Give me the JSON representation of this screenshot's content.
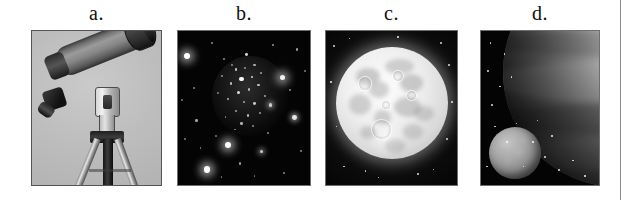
{
  "figure": {
    "caption_style": "lettered-panels",
    "panel_count": 4,
    "background_color": "#ffffff",
    "margin_rule_color": "#8a8a8a"
  },
  "panels": [
    {
      "id": "a",
      "label": "a.",
      "subject": "telescope-on-tripod",
      "alt": "A refracting telescope mounted on a metal tripod, photographed against a plain light gray studio background.",
      "background_color": "#b9b9b9",
      "frame_border_color": "#555555"
    },
    {
      "id": "b",
      "label": "b.",
      "subject": "star-cluster",
      "alt": "A dense field of stars forming an open star cluster against a black night sky.",
      "background_color": "#040404",
      "frame_border_color": "#6e6e6e"
    },
    {
      "id": "c",
      "label": "c.",
      "subject": "full-moon",
      "alt": "The full Moon showing bright highlands, dark maria and bright crater ray systems.",
      "background_color": "#0a0a0a",
      "frame_border_color": "#6e6e6e"
    },
    {
      "id": "d",
      "label": "d.",
      "subject": "planet-and-moon",
      "alt": "The limb of a large banded planet at upper right with a smaller gray moon at lower left.",
      "background_color": "#050505",
      "frame_border_color": "#6e6e6e"
    }
  ],
  "stars": {
    "cluster_members": [
      {
        "x": 35,
        "y": 18,
        "r": 1.0,
        "b": 0.55
      },
      {
        "x": 44,
        "y": 25,
        "r": 1.2,
        "b": 0.75
      },
      {
        "x": 52,
        "y": 15,
        "r": 1.4,
        "b": 0.85
      },
      {
        "x": 58,
        "y": 22,
        "r": 1.1,
        "b": 0.65
      },
      {
        "x": 48,
        "y": 31,
        "r": 2.2,
        "b": 1.0
      },
      {
        "x": 56,
        "y": 30,
        "r": 1.3,
        "b": 0.8
      },
      {
        "x": 63,
        "y": 27,
        "r": 1.0,
        "b": 0.6
      },
      {
        "x": 40,
        "y": 34,
        "r": 1.2,
        "b": 0.7
      },
      {
        "x": 33,
        "y": 29,
        "r": 1.0,
        "b": 0.55
      },
      {
        "x": 46,
        "y": 40,
        "r": 1.5,
        "b": 0.85
      },
      {
        "x": 54,
        "y": 38,
        "r": 1.1,
        "b": 0.65
      },
      {
        "x": 61,
        "y": 35,
        "r": 1.3,
        "b": 0.72
      },
      {
        "x": 38,
        "y": 44,
        "r": 1.2,
        "b": 0.68
      },
      {
        "x": 50,
        "y": 46,
        "r": 1.0,
        "b": 0.6
      },
      {
        "x": 58,
        "y": 47,
        "r": 1.4,
        "b": 0.78
      },
      {
        "x": 44,
        "y": 52,
        "r": 1.1,
        "b": 0.62
      },
      {
        "x": 53,
        "y": 55,
        "r": 1.3,
        "b": 0.7
      },
      {
        "x": 36,
        "y": 56,
        "r": 0.9,
        "b": 0.5
      },
      {
        "x": 62,
        "y": 53,
        "r": 1.0,
        "b": 0.58
      },
      {
        "x": 48,
        "y": 60,
        "r": 1.2,
        "b": 0.66
      },
      {
        "x": 41,
        "y": 22,
        "r": 0.9,
        "b": 0.5
      },
      {
        "x": 66,
        "y": 42,
        "r": 1.1,
        "b": 0.62
      },
      {
        "x": 30,
        "y": 40,
        "r": 0.9,
        "b": 0.48
      },
      {
        "x": 57,
        "y": 62,
        "r": 1.0,
        "b": 0.55
      },
      {
        "x": 43,
        "y": 64,
        "r": 0.9,
        "b": 0.5
      },
      {
        "x": 51,
        "y": 24,
        "r": 0.9,
        "b": 0.52
      }
    ],
    "field_stars": [
      {
        "x": 7,
        "y": 16,
        "r": 3.0,
        "b": 1.0,
        "glow": "big"
      },
      {
        "x": 79,
        "y": 30,
        "r": 2.6,
        "b": 0.95,
        "glow": "big"
      },
      {
        "x": 88,
        "y": 56,
        "r": 2.4,
        "b": 0.9,
        "glow": "yes"
      },
      {
        "x": 38,
        "y": 74,
        "r": 3.0,
        "b": 1.0,
        "glow": "big"
      },
      {
        "x": 22,
        "y": 90,
        "r": 3.2,
        "b": 1.0,
        "glow": "big"
      },
      {
        "x": 70,
        "y": 48,
        "r": 1.8,
        "b": 0.8,
        "glow": "yes"
      },
      {
        "x": 63,
        "y": 78,
        "r": 1.6,
        "b": 0.78,
        "glow": "yes"
      },
      {
        "x": 14,
        "y": 58,
        "r": 1.2,
        "b": 0.62
      },
      {
        "x": 90,
        "y": 12,
        "r": 1.2,
        "b": 0.6
      },
      {
        "x": 26,
        "y": 8,
        "r": 1.0,
        "b": 0.55
      },
      {
        "x": 72,
        "y": 9,
        "r": 1.1,
        "b": 0.58
      },
      {
        "x": 12,
        "y": 37,
        "r": 1.0,
        "b": 0.52
      },
      {
        "x": 5,
        "y": 70,
        "r": 1.0,
        "b": 0.5
      },
      {
        "x": 93,
        "y": 78,
        "r": 1.1,
        "b": 0.56
      },
      {
        "x": 47,
        "y": 86,
        "r": 1.2,
        "b": 0.6
      },
      {
        "x": 80,
        "y": 92,
        "r": 1.0,
        "b": 0.52
      },
      {
        "x": 33,
        "y": 95,
        "r": 0.9,
        "b": 0.48
      },
      {
        "x": 58,
        "y": 94,
        "r": 0.9,
        "b": 0.46
      },
      {
        "x": 17,
        "y": 76,
        "r": 0.9,
        "b": 0.48
      },
      {
        "x": 85,
        "y": 38,
        "r": 1.0,
        "b": 0.54
      },
      {
        "x": 96,
        "y": 26,
        "r": 0.9,
        "b": 0.48
      },
      {
        "x": 3,
        "y": 45,
        "r": 0.9,
        "b": 0.46
      },
      {
        "x": 68,
        "y": 66,
        "r": 1.0,
        "b": 0.52
      },
      {
        "x": 29,
        "y": 68,
        "r": 0.9,
        "b": 0.45
      }
    ],
    "moon_panel_stars": [
      {
        "x": 6,
        "y": 10,
        "r": 1.0
      },
      {
        "x": 18,
        "y": 5,
        "r": 0.8
      },
      {
        "x": 88,
        "y": 8,
        "r": 1.1
      },
      {
        "x": 94,
        "y": 22,
        "r": 0.9
      },
      {
        "x": 4,
        "y": 33,
        "r": 0.8
      },
      {
        "x": 96,
        "y": 46,
        "r": 0.9
      },
      {
        "x": 8,
        "y": 62,
        "r": 0.8
      },
      {
        "x": 92,
        "y": 70,
        "r": 1.0
      },
      {
        "x": 14,
        "y": 88,
        "r": 0.9
      },
      {
        "x": 40,
        "y": 95,
        "r": 0.8
      },
      {
        "x": 70,
        "y": 93,
        "r": 0.9
      },
      {
        "x": 55,
        "y": 4,
        "r": 0.8
      },
      {
        "x": 30,
        "y": 91,
        "r": 0.8
      },
      {
        "x": 82,
        "y": 90,
        "r": 0.8
      }
    ],
    "planet_panel_stars": [
      {
        "x": 8,
        "y": 8,
        "r": 0.9
      },
      {
        "x": 20,
        "y": 15,
        "r": 0.8
      },
      {
        "x": 6,
        "y": 26,
        "r": 0.9
      },
      {
        "x": 16,
        "y": 36,
        "r": 0.8
      },
      {
        "x": 9,
        "y": 48,
        "r": 0.9
      },
      {
        "x": 26,
        "y": 30,
        "r": 0.8
      },
      {
        "x": 30,
        "y": 60,
        "r": 0.9
      },
      {
        "x": 44,
        "y": 72,
        "r": 0.8
      },
      {
        "x": 54,
        "y": 82,
        "r": 0.9
      },
      {
        "x": 36,
        "y": 88,
        "r": 0.8
      },
      {
        "x": 66,
        "y": 90,
        "r": 0.9
      },
      {
        "x": 22,
        "y": 72,
        "r": 0.8
      },
      {
        "x": 12,
        "y": 62,
        "r": 0.8
      },
      {
        "x": 48,
        "y": 58,
        "r": 0.8
      },
      {
        "x": 60,
        "y": 68,
        "r": 0.8
      },
      {
        "x": 78,
        "y": 84,
        "r": 0.8
      },
      {
        "x": 88,
        "y": 94,
        "r": 0.8
      },
      {
        "x": 5,
        "y": 88,
        "r": 0.8
      }
    ]
  },
  "moon_features": {
    "maria": [
      {
        "x": 18,
        "y": 18,
        "w": 22,
        "h": 16,
        "o": 0.35
      },
      {
        "x": 44,
        "y": 10,
        "w": 26,
        "h": 14,
        "o": 0.3
      },
      {
        "x": 58,
        "y": 24,
        "w": 20,
        "h": 16,
        "o": 0.34
      },
      {
        "x": 30,
        "y": 30,
        "w": 18,
        "h": 15,
        "o": 0.32
      },
      {
        "x": 12,
        "y": 42,
        "w": 20,
        "h": 18,
        "o": 0.3
      },
      {
        "x": 52,
        "y": 44,
        "w": 24,
        "h": 18,
        "o": 0.33
      },
      {
        "x": 70,
        "y": 52,
        "w": 18,
        "h": 14,
        "o": 0.28
      },
      {
        "x": 34,
        "y": 56,
        "w": 16,
        "h": 13,
        "o": 0.3
      },
      {
        "x": 60,
        "y": 68,
        "w": 18,
        "h": 14,
        "o": 0.26
      },
      {
        "x": 22,
        "y": 70,
        "w": 14,
        "h": 12,
        "o": 0.28
      },
      {
        "x": 44,
        "y": 82,
        "w": 18,
        "h": 12,
        "o": 0.24
      }
    ],
    "craters": [
      {
        "x": 32,
        "y": 64,
        "d": 17
      },
      {
        "x": 20,
        "y": 26,
        "d": 11
      },
      {
        "x": 50,
        "y": 20,
        "d": 9
      },
      {
        "x": 63,
        "y": 38,
        "d": 8
      },
      {
        "x": 41,
        "y": 47,
        "d": 7
      }
    ],
    "ray_system": {
      "x": 22,
      "y": 60,
      "w": 46,
      "h": 40
    }
  },
  "planet_features": {
    "bands": [
      {
        "top": 14,
        "h": 16,
        "color": "rgba(255,255,255,0.20)"
      },
      {
        "top": 32,
        "h": 11,
        "color": "rgba(0,0,0,0.16)"
      },
      {
        "top": 45,
        "h": 18,
        "color": "rgba(255,255,255,0.13)"
      },
      {
        "top": 64,
        "h": 13,
        "color": "rgba(0,0,0,0.20)"
      },
      {
        "top": 79,
        "h": 14,
        "color": "rgba(255,255,255,0.08)"
      }
    ],
    "moon_mottle": [
      {
        "x": 22,
        "y": 26,
        "w": 16,
        "h": 12
      },
      {
        "x": 52,
        "y": 44,
        "w": 14,
        "h": 11
      },
      {
        "x": 30,
        "y": 62,
        "w": 12,
        "h": 10
      },
      {
        "x": 62,
        "y": 20,
        "w": 10,
        "h": 8
      }
    ]
  }
}
